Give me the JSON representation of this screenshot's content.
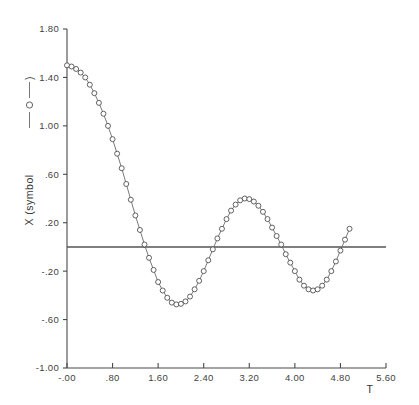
{
  "chart_data": {
    "type": "line",
    "title": "",
    "xlabel": "T",
    "ylabel": "X  (symbol",
    "ylabel_suffix": ")",
    "legend_symbol": "open-circle-with-line",
    "xlim": [
      0.0,
      5.6
    ],
    "ylim": [
      -1.0,
      1.8
    ],
    "grid": false,
    "legend_position": "y-axis-label-inline",
    "zero_reference_line": 0.0,
    "xticks": [
      "-.00",
      ".80",
      "1.60",
      "2.40",
      "3.20",
      "4.00",
      "4.80",
      "5.60"
    ],
    "xtick_values": [
      0.0,
      0.8,
      1.6,
      2.4,
      3.2,
      4.0,
      4.8,
      5.6
    ],
    "yticks": [
      "1.80",
      "1.40",
      "1.00",
      ".60",
      ".20",
      "-.20",
      "-.60",
      "-1.00"
    ],
    "ytick_values": [
      1.8,
      1.4,
      1.0,
      0.6,
      0.2,
      -0.2,
      -0.6,
      -1.0
    ],
    "series": [
      {
        "name": "X",
        "marker": "circle",
        "line_style": "solid",
        "x": [
          0.0,
          0.08,
          0.16,
          0.24,
          0.32,
          0.4,
          0.48,
          0.56,
          0.64,
          0.72,
          0.8,
          0.88,
          0.96,
          1.04,
          1.12,
          1.2,
          1.28,
          1.36,
          1.44,
          1.52,
          1.6,
          1.68,
          1.76,
          1.84,
          1.92,
          2.0,
          2.08,
          2.16,
          2.24,
          2.32,
          2.4,
          2.48,
          2.56,
          2.64,
          2.72,
          2.8,
          2.88,
          2.96,
          3.04,
          3.12,
          3.2,
          3.28,
          3.36,
          3.44,
          3.52,
          3.6,
          3.68,
          3.76,
          3.84,
          3.92,
          4.0,
          4.08,
          4.16,
          4.24,
          4.32,
          4.4,
          4.48,
          4.56,
          4.64,
          4.72,
          4.8,
          4.88,
          4.96
        ],
        "y": [
          1.5,
          1.49,
          1.47,
          1.44,
          1.4,
          1.34,
          1.27,
          1.19,
          1.1,
          1.0,
          0.89,
          0.77,
          0.65,
          0.52,
          0.39,
          0.26,
          0.14,
          0.02,
          -0.09,
          -0.19,
          -0.29,
          -0.36,
          -0.42,
          -0.46,
          -0.475,
          -0.47,
          -0.45,
          -0.41,
          -0.35,
          -0.28,
          -0.2,
          -0.11,
          -0.02,
          0.07,
          0.15,
          0.23,
          0.3,
          0.35,
          0.385,
          0.4,
          0.395,
          0.375,
          0.34,
          0.29,
          0.23,
          0.16,
          0.09,
          0.02,
          -0.06,
          -0.13,
          -0.2,
          -0.27,
          -0.32,
          -0.35,
          -0.36,
          -0.35,
          -0.32,
          -0.27,
          -0.2,
          -0.12,
          -0.03,
          0.06,
          0.15
        ]
      }
    ]
  }
}
